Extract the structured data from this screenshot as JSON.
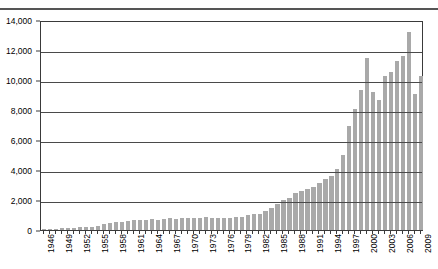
{
  "chart_data": {
    "type": "bar",
    "title": "",
    "subtitle": "",
    "xlabel": "",
    "ylabel": "",
    "ylim": [
      0,
      14000
    ],
    "ytick_values": [
      0,
      2000,
      4000,
      6000,
      8000,
      10000,
      12000,
      14000
    ],
    "ytick_labels": [
      "0",
      "2,000",
      "4,000",
      "6,000",
      "8,000",
      "10,000",
      "12,000",
      "14,000"
    ],
    "grid": true,
    "grid_axis": "y",
    "legend": false,
    "legend_position": "none",
    "bar_color": "#a9a9a9",
    "axis_color": "#3a3a3a",
    "xtick_labels_shown": [
      "1946",
      "1949",
      "1952",
      "1955",
      "1958",
      "1961",
      "1964",
      "1967",
      "1970",
      "1973",
      "1976",
      "1979",
      "1982",
      "1985",
      "1988",
      "1991",
      "1994",
      "1997",
      "2000",
      "2003",
      "2006",
      "2009"
    ],
    "xtick_label_interval": 3,
    "categories": [
      "1946",
      "1947",
      "1948",
      "1949",
      "1950",
      "1951",
      "1952",
      "1953",
      "1954",
      "1955",
      "1956",
      "1957",
      "1958",
      "1959",
      "1960",
      "1961",
      "1962",
      "1963",
      "1964",
      "1965",
      "1966",
      "1967",
      "1968",
      "1969",
      "1970",
      "1971",
      "1972",
      "1973",
      "1974",
      "1975",
      "1976",
      "1977",
      "1978",
      "1979",
      "1980",
      "1981",
      "1982",
      "1983",
      "1984",
      "1985",
      "1986",
      "1987",
      "1988",
      "1989",
      "1990",
      "1991",
      "1992",
      "1993",
      "1994",
      "1995",
      "1996",
      "1997",
      "1998",
      "1999",
      "2000",
      "2001",
      "2002",
      "2003",
      "2004",
      "2005",
      "2006",
      "2007",
      "2008",
      "2009"
    ],
    "values": [
      60,
      80,
      100,
      110,
      130,
      150,
      170,
      190,
      230,
      300,
      380,
      450,
      520,
      560,
      600,
      640,
      660,
      700,
      730,
      700,
      740,
      780,
      760,
      800,
      820,
      780,
      800,
      840,
      820,
      800,
      780,
      820,
      860,
      900,
      980,
      1050,
      1100,
      1250,
      1500,
      1750,
      2000,
      2150,
      2500,
      2600,
      2750,
      2900,
      3150,
      3400,
      3600,
      4050,
      5000,
      6950,
      8050,
      9350,
      11450,
      9200,
      8700,
      10250,
      10550,
      11250,
      11600,
      13200,
      9100,
      10300
    ]
  }
}
